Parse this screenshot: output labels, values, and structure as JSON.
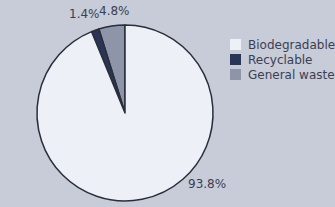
{
  "chart_data": {
    "type": "pie",
    "title": "",
    "categories": [
      "Biodegradable",
      "Recyclable",
      "General waste"
    ],
    "values": [
      93.8,
      1.4,
      4.8
    ],
    "labels": [
      "93.8%",
      "1.4%",
      "4.8%"
    ],
    "colors": [
      "#eef0f7",
      "#2a3558",
      "#8f95a8"
    ],
    "start_angle_deg": 0,
    "direction": "counterclockwise-from-top for small slices",
    "legend_position": "right"
  },
  "legend": {
    "items": [
      {
        "label": "Biodegradable",
        "color": "#eef0f7"
      },
      {
        "label": "Recyclable",
        "color": "#2a3558"
      },
      {
        "label": "General waste",
        "color": "#8f95a8"
      }
    ]
  },
  "slice_labels": {
    "biodegradable": "93.8%",
    "recyclable": "1.4%",
    "general_waste": "4.8%"
  },
  "colors": {
    "background": "#c8cbd8",
    "outline": "#2a2e3a",
    "text": "#3a3f52"
  }
}
